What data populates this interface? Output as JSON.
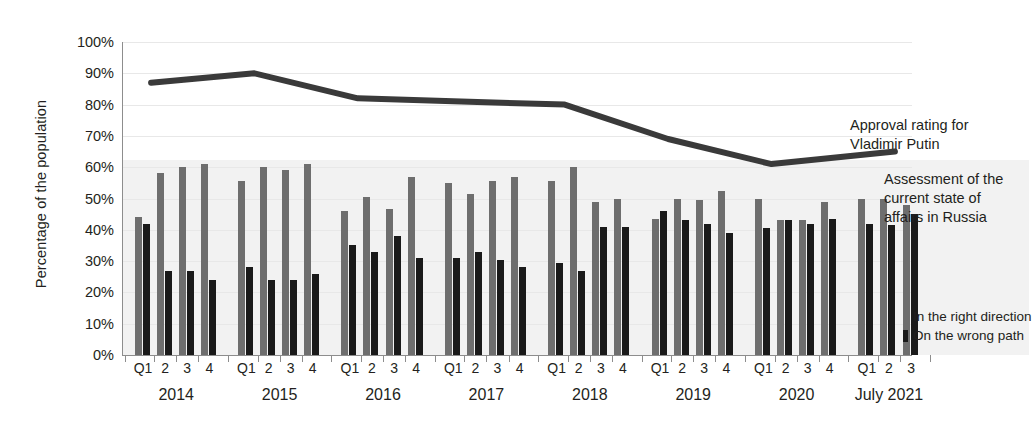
{
  "chart_data": {
    "type": "bar",
    "title": "",
    "xlabel": "",
    "ylabel": "Percentage of the population",
    "ylim": [
      0,
      100
    ],
    "ytick_labels": [
      "100%",
      "90%",
      "80%",
      "70%",
      "60%",
      "50%",
      "40%",
      "30%",
      "20%",
      "10%",
      "0%"
    ],
    "ytick_values": [
      100,
      90,
      80,
      70,
      60,
      50,
      40,
      30,
      20,
      10,
      0
    ],
    "grid": true,
    "legend_position": "right",
    "quarter_labels": [
      "Q1",
      "2",
      "3",
      "4"
    ],
    "groups": [
      {
        "year_label": "2014",
        "quarters": [
          "Q1",
          "2",
          "3",
          "4"
        ]
      },
      {
        "year_label": "2015",
        "quarters": [
          "Q1",
          "2",
          "3",
          "4"
        ]
      },
      {
        "year_label": "2016",
        "quarters": [
          "Q1",
          "2",
          "3",
          "4"
        ]
      },
      {
        "year_label": "2017",
        "quarters": [
          "Q1",
          "2",
          "3",
          "4"
        ]
      },
      {
        "year_label": "2018",
        "quarters": [
          "Q1",
          "2",
          "3",
          "4"
        ]
      },
      {
        "year_label": "2019",
        "quarters": [
          "Q1",
          "2",
          "3",
          "4"
        ]
      },
      {
        "year_label": "2020",
        "quarters": [
          "Q1",
          "2",
          "3",
          "4"
        ]
      },
      {
        "year_label": "July 2021",
        "quarters": [
          "Q1",
          "2",
          "3"
        ]
      }
    ],
    "categories": [
      "2014 Q1",
      "2014 Q2",
      "2014 Q3",
      "2014 Q4",
      "2015 Q1",
      "2015 Q2",
      "2015 Q3",
      "2015 Q4",
      "2016 Q1",
      "2016 Q2",
      "2016 Q3",
      "2016 Q4",
      "2017 Q1",
      "2017 Q2",
      "2017 Q3",
      "2017 Q4",
      "2018 Q1",
      "2018 Q2",
      "2018 Q3",
      "2018 Q4",
      "2019 Q1",
      "2019 Q2",
      "2019 Q3",
      "2019 Q4",
      "2020 Q1",
      "2020 Q2",
      "2020 Q3",
      "2020 Q4",
      "2021 Q1",
      "2021 Q2",
      "2021 Q3"
    ],
    "series": [
      {
        "name": "In the right direction",
        "color": "#6e6e6e",
        "values": [
          44,
          58,
          60,
          61,
          55.5,
          60,
          59,
          61,
          46,
          50.5,
          46.5,
          57,
          55,
          51.5,
          55.5,
          57,
          55.5,
          60,
          49,
          50,
          43.5,
          50,
          49.5,
          52.5,
          50,
          43,
          43,
          49,
          50,
          50,
          48
        ]
      },
      {
        "name": "On the wrong path",
        "color": "#1a1a1a",
        "values": [
          42,
          27,
          27,
          24,
          28,
          24,
          24,
          26,
          35,
          33,
          38,
          31,
          31,
          33,
          30.5,
          28,
          29.5,
          27,
          41,
          41,
          46,
          43,
          42,
          39,
          40.5,
          43,
          42,
          43.5,
          42,
          41.5,
          45
        ]
      }
    ],
    "line_series": {
      "name": "Approval rating for Vladimir Putin",
      "color": "#3a3a3a",
      "x_labels": [
        "2014",
        "2015",
        "2016",
        "2017",
        "2018",
        "2019",
        "2020",
        "2021"
      ],
      "values": [
        87,
        90,
        82,
        81,
        80,
        69,
        61,
        65
      ]
    },
    "annotations": [
      {
        "id": "line-annotation",
        "text": "Approval rating for Vladimir Putin"
      },
      {
        "id": "bars-annotation",
        "text": "Assessment of the current state of affairs in Russia"
      }
    ]
  },
  "annotations": {
    "line_label_line1": "Approval rating for",
    "line_label_line2": "Vladimir Putin",
    "bars_label_line1": "Assessment of the",
    "bars_label_line2": "current state of",
    "bars_label_line3": "affairs in Russia"
  },
  "legend": {
    "items": [
      {
        "label": "In the right direction",
        "color": "#6e6e6e"
      },
      {
        "label": "On the wrong path",
        "color": "#1a1a1a"
      }
    ]
  }
}
